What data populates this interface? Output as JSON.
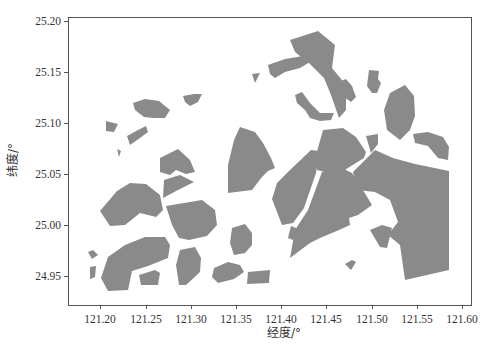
{
  "chart_data": {
    "type": "map",
    "title": "",
    "xlabel": "经度/°",
    "ylabel": "纬度/°",
    "xlim": [
      121.165,
      121.605
    ],
    "ylim": [
      24.918,
      25.205
    ],
    "grid": false,
    "legend": null,
    "xticks": [
      "121.20",
      "121.25",
      "121.30",
      "121.35",
      "121.40",
      "121.45",
      "121.50",
      "121.55",
      "121.60"
    ],
    "yticks": [
      "25.20",
      "25.15",
      "25.10",
      "25.05",
      "25.00",
      "24.95"
    ],
    "fill_color": "#8a8a8a",
    "regions_description": "Gray filled polygons representing land parcels / districts spread across roughly 121.18–121.59°E, 24.93–25.19°N, denser toward the east"
  },
  "layout": {
    "plot": {
      "left": 68,
      "top": 17,
      "right": 471,
      "bottom": 305
    },
    "xtick_px": [
      100,
      146,
      191,
      236,
      281,
      326,
      372,
      417,
      462
    ],
    "ytick_px": [
      21,
      72,
      123,
      174,
      225,
      276
    ]
  },
  "labels": {
    "xlabel": "经度/°",
    "ylabel": "纬度/°",
    "xticks": [
      "121.20",
      "121.25",
      "121.30",
      "121.35",
      "121.40",
      "121.45",
      "121.50",
      "121.55",
      "121.60"
    ],
    "yticks": [
      "25.20",
      "25.15",
      "25.10",
      "25.05",
      "25.00",
      "24.95"
    ]
  },
  "polygons": [
    "290,40 318,31 335,45 332,68 346,85 346,110 339,118 331,95 324,78 310,64 295,52",
    "268,65 285,59 303,56 310,62 300,68 285,72 275,78 270,74",
    "252,74 260,73 255,83",
    "295,95 302,92 310,103 320,113 334,113 331,120 320,121 310,118 305,110 297,103",
    "336,83 346,79 352,86 356,97 351,102 344,97",
    "369,70 379,71 378,79 381,83 377,93 372,93 367,86",
    "390,93 405,85 414,96 415,116 410,130 400,140 387,130 384,110",
    "413,134 428,132 443,137 449,147 448,160 438,158 428,146 415,143",
    "240,127 255,132 263,143 271,158 275,168 268,171 262,177 252,190 228,193 228,165 234,140",
    "323,130 343,128 356,137 366,152 364,158 351,166 337,175 317,170 316,155",
    "366,136 378,134 378,144 371,153",
    "311,150 319,151 318,160 316,173 304,208 293,223 282,225 272,199 277,183 290,170",
    "322,172 340,167 352,173 366,195 372,205 358,215 349,218 350,225 339,230 320,238 310,243 290,258 295,230 308,210",
    "353,172 375,150 393,158 415,164 449,171 449,270 405,280 400,245 388,235 398,222 390,200 375,192 357,190",
    "370,230 382,225 392,228 387,248 380,247",
    "345,264 352,260 356,262 351,270",
    "133,103 145,99 159,101 170,110 165,118 153,118 144,117 135,110",
    "183,96 194,94 202,94 198,102 190,106 185,102",
    "106,121 118,124 114,132 106,131",
    "127,136 138,130 146,126 148,132 140,138 130,145",
    "117,149 121,151 119,157",
    "160,158 178,149 190,160 195,172 186,174 176,170 170,175 160,172",
    "164,180 180,175 194,182 178,190 163,198",
    "117,191 130,183 146,184 160,195 163,210 156,217 140,213 125,225 110,226 100,211",
    "166,206 202,200 215,210 217,225 207,236 189,240 179,238 172,225",
    "88,252 93,250 98,255 92,259",
    "90,267 96,266 95,277 90,279",
    "108,257 125,245 145,237 165,237 170,245 168,258 148,266 132,271 128,290 108,291 101,278",
    "139,275 155,270 160,273 158,285 141,285",
    "180,250 195,247 201,258 200,272 186,285 179,285 176,265",
    "232,228 245,224 252,233 252,245 245,253 234,255 230,243",
    "214,268 228,262 240,265 244,272 234,279 218,283 212,277",
    "248,272 270,270 269,283 247,284",
    "291,226 296,228 296,236 293,240 288,238",
    "407,168 425,166 443,172 449,185 440,190 423,183"
  ]
}
